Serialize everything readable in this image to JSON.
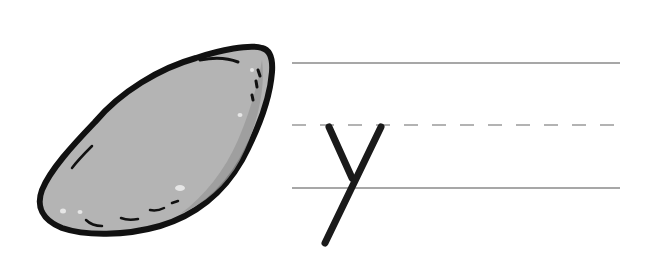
{
  "worksheet": {
    "letter": "y",
    "picture": "yam",
    "picture_icon": "yam-icon",
    "colors": {
      "outline": "#111111",
      "fill": "#b4b4b4",
      "fill_shadow": "#9a9a9a",
      "highlight": "#e6e6e6",
      "guide_line": "#8a8a8a",
      "letter_stroke": "#1a1a1a",
      "background": "#ffffff"
    },
    "guide_lines": {
      "top_y": 63,
      "mid_y": 125,
      "base_y": 188,
      "x_start": 292,
      "x_end": 620
    }
  }
}
